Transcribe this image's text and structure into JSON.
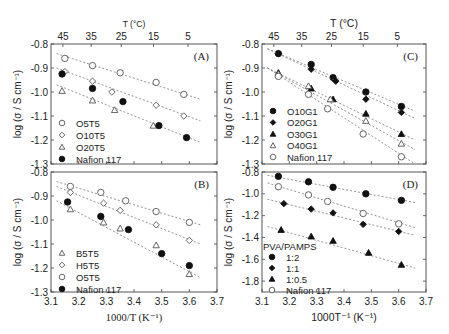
{
  "chart_data": [
    {
      "id": "A",
      "type": "scatter",
      "panel_label": "(A)",
      "frame": {
        "x0": 51,
        "x1": 217,
        "y0": 44,
        "y1": 164
      },
      "xlim": [
        3.1,
        3.7
      ],
      "ylim": [
        -1.3,
        -0.8
      ],
      "yticks": [
        -0.8,
        -0.9,
        -1.0,
        -1.1,
        -1.2,
        -1.3
      ],
      "ytick_labels": [
        "-0.8",
        "-0.9",
        "-1.0",
        "-1.1",
        "-1.2",
        "-1.3"
      ],
      "top_axis": {
        "label": "T (°C)",
        "ticks": [
          45,
          35,
          25,
          15,
          5
        ]
      },
      "ylabel": "log (σ / S cm⁻¹)",
      "xlabel": "",
      "legend": {
        "x": 62,
        "y": 126,
        "dy": 12
      },
      "series": [
        {
          "name": "O5T5",
          "marker": "circle-open",
          "x": [
            3.15,
            3.25,
            3.35,
            3.48,
            3.58
          ],
          "y": [
            -0.86,
            -0.89,
            -0.92,
            -0.96,
            -1.01
          ],
          "fit": [
            [
              3.12,
              -0.84
            ],
            [
              3.64,
              -1.03
            ]
          ]
        },
        {
          "name": "O10T5",
          "marker": "diamond-open",
          "x": [
            3.15,
            3.25,
            3.32,
            3.48,
            3.58
          ],
          "y": [
            -0.915,
            -0.955,
            -1.0,
            -1.055,
            -1.1
          ],
          "fit": [
            [
              3.12,
              -0.9
            ],
            [
              3.64,
              -1.12
            ]
          ]
        },
        {
          "name": "O20T5",
          "marker": "triangle-open",
          "x": [
            3.14,
            3.25,
            3.33,
            3.47
          ],
          "y": [
            -0.995,
            -1.035,
            -1.075,
            -1.14
          ],
          "fit": [
            [
              3.12,
              -0.97
            ],
            [
              3.64,
              -1.21
            ]
          ]
        },
        {
          "name": "Nafion 117",
          "marker": "circle-filled",
          "x": [
            3.14,
            3.25,
            3.36,
            3.49,
            3.59
          ],
          "y": [
            -0.925,
            -0.985,
            -1.04,
            -1.14,
            -1.19
          ],
          "fit": null
        }
      ]
    },
    {
      "id": "B",
      "type": "scatter",
      "panel_label": "(B)",
      "frame": {
        "x0": 51,
        "x1": 217,
        "y0": 172,
        "y1": 292
      },
      "xlim": [
        3.1,
        3.7
      ],
      "ylim": [
        -1.3,
        -0.8
      ],
      "xticks": [
        3.1,
        3.2,
        3.3,
        3.4,
        3.5,
        3.6,
        3.7
      ],
      "xtick_labels": [
        "3.1",
        "3.2",
        "3.3",
        "3.4",
        "3.5",
        "3.6",
        "3.7"
      ],
      "yticks": [
        -0.8,
        -0.9,
        -1.0,
        -1.1,
        -1.2,
        -1.3
      ],
      "ytick_labels": [
        "-0.8",
        "-0.9",
        "-1.0",
        "-1.1",
        "-1.2",
        "-1.3"
      ],
      "ylabel": "log (σ / S cm⁻¹)",
      "xlabel": "1000/T (K⁻¹)",
      "legend": {
        "x": 62,
        "y": 256,
        "dy": 12
      },
      "series": [
        {
          "name": "B5T5",
          "marker": "triangle-open",
          "x": [
            3.17,
            3.29,
            3.35,
            3.48,
            3.6
          ],
          "y": [
            -0.955,
            -1.01,
            -1.035,
            -1.105,
            -1.225
          ],
          "fit": [
            [
              3.12,
              -0.92
            ],
            [
              3.64,
              -1.24
            ]
          ]
        },
        {
          "name": "H5T5",
          "marker": "diamond-open",
          "x": [
            3.17,
            3.29,
            3.35,
            3.48,
            3.6
          ],
          "y": [
            -0.885,
            -0.93,
            -0.96,
            -1.02,
            -1.085
          ],
          "fit": [
            [
              3.12,
              -0.86
            ],
            [
              3.64,
              -1.1
            ]
          ]
        },
        {
          "name": "O5T5",
          "marker": "circle-open",
          "x": [
            3.17,
            3.28,
            3.37,
            3.48,
            3.6
          ],
          "y": [
            -0.86,
            -0.885,
            -0.92,
            -0.965,
            -1.01
          ],
          "fit": [
            [
              3.12,
              -0.84
            ],
            [
              3.64,
              -1.02
            ]
          ]
        },
        {
          "name": "Nafion 117",
          "marker": "circle-filled",
          "x": [
            3.16,
            3.28,
            3.38,
            3.5,
            3.6
          ],
          "y": [
            -0.925,
            -0.985,
            -1.04,
            -1.14,
            -1.19
          ],
          "fit": null
        }
      ]
    },
    {
      "id": "C",
      "type": "scatter",
      "panel_label": "(C)",
      "frame": {
        "x0": 262,
        "x1": 426,
        "y0": 44,
        "y1": 164
      },
      "xlim": [
        3.1,
        3.7
      ],
      "ylim": [
        -1.3,
        -0.8
      ],
      "yticks": [
        -0.8,
        -0.9,
        -1.0,
        -1.1,
        -1.2,
        -1.3
      ],
      "ytick_labels": [
        "-0.8",
        "-0.9",
        "-1.0",
        "-1.1",
        "-1.2",
        "-1.3"
      ],
      "top_axis": {
        "label": "T (°C)",
        "ticks": [
          45,
          35,
          25,
          15,
          5
        ]
      },
      "ylabel": "log (σ / S cm⁻¹)",
      "xlabel": "",
      "legend": {
        "x": 273,
        "y": 114,
        "dy": 11.5
      },
      "series": [
        {
          "name": "O10G1",
          "marker": "circle-filled",
          "x": [
            3.16,
            3.28,
            3.36,
            3.48,
            3.61
          ],
          "y": [
            -0.84,
            -0.885,
            -0.94,
            -1.0,
            -1.06
          ],
          "fit": [
            [
              3.12,
              -0.82
            ],
            [
              3.66,
              -1.08
            ]
          ]
        },
        {
          "name": "O20G1",
          "marker": "diamond-filled",
          "x": [
            3.16,
            3.28,
            3.37,
            3.48,
            3.61
          ],
          "y": [
            -0.84,
            -0.905,
            -0.955,
            -1.03,
            -1.085
          ],
          "fit": [
            [
              3.12,
              -0.82
            ],
            [
              3.66,
              -1.11
            ]
          ]
        },
        {
          "name": "O30G1",
          "marker": "triangle-filled",
          "x": [
            3.16,
            3.28,
            3.36,
            3.48,
            3.61
          ],
          "y": [
            -0.92,
            -0.985,
            -1.03,
            -1.09,
            -1.175
          ],
          "fit": [
            [
              3.12,
              -0.9
            ],
            [
              3.66,
              -1.2
            ]
          ]
        },
        {
          "name": "O40G1",
          "marker": "triangle-open",
          "x": [
            3.16,
            3.27,
            3.35,
            3.48,
            3.61
          ],
          "y": [
            -0.925,
            -0.975,
            -1.03,
            -1.12,
            -1.215
          ],
          "fit": [
            [
              3.12,
              -0.9
            ],
            [
              3.66,
              -1.24
            ]
          ]
        },
        {
          "name": "Nafion 117",
          "marker": "circle-open",
          "x": [
            3.16,
            3.27,
            3.34,
            3.47,
            3.61
          ],
          "y": [
            -0.935,
            -1.01,
            -1.07,
            -1.175,
            -1.27
          ],
          "fit": [
            [
              3.12,
              -0.9
            ],
            [
              3.66,
              -1.3
            ]
          ]
        }
      ]
    },
    {
      "id": "D",
      "type": "scatter",
      "panel_label": "(D)",
      "frame": {
        "x0": 262,
        "x1": 426,
        "y0": 172,
        "y1": 292
      },
      "xlim": [
        3.1,
        3.7
      ],
      "ylim": [
        -1.9,
        -0.8
      ],
      "xticks": [
        3.1,
        3.2,
        3.3,
        3.4,
        3.5,
        3.6,
        3.7
      ],
      "xtick_labels": [
        "3.1",
        "3.2",
        "3.3",
        "3.4",
        "3.5",
        "3.6",
        "3.7"
      ],
      "yticks": [
        -0.8,
        -1.0,
        -1.2,
        -1.4,
        -1.6,
        -1.8
      ],
      "ytick_labels": [
        "-0.8",
        "-1.0",
        "-1.2",
        "-1.4",
        "-1.6",
        "-1.8"
      ],
      "ylabel": "log (σ / S cm⁻¹)",
      "xlabel": "1000T⁻¹ (K⁻¹)",
      "legend_title": "PVA/PAMPS",
      "legend": {
        "x": 272,
        "y": 256,
        "dy": 11
      },
      "series": [
        {
          "name": "1:2",
          "marker": "circle-filled",
          "x": [
            3.16,
            3.27,
            3.36,
            3.48,
            3.61
          ],
          "y": [
            -0.84,
            -0.89,
            -0.94,
            -1.0,
            -1.06
          ],
          "fit": [
            [
              3.12,
              -0.83
            ],
            [
              3.66,
              -1.08
            ]
          ]
        },
        {
          "name": "1:1",
          "marker": "diamond-filled",
          "x": [
            3.18,
            3.28,
            3.36,
            3.47,
            3.6
          ],
          "y": [
            -1.09,
            -1.14,
            -1.175,
            -1.28,
            -1.345
          ],
          "fit": [
            [
              3.12,
              -1.05
            ],
            [
              3.66,
              -1.38
            ]
          ]
        },
        {
          "name": "1:0.5",
          "marker": "triangle-filled",
          "x": [
            3.17,
            3.28,
            3.36,
            3.49,
            3.61
          ],
          "y": [
            -1.33,
            -1.39,
            -1.43,
            -1.54,
            -1.65
          ],
          "fit": [
            [
              3.12,
              -1.3
            ],
            [
              3.66,
              -1.68
            ]
          ]
        },
        {
          "name": "Nafion 117",
          "marker": "circle-open",
          "x": [
            3.16,
            3.27,
            3.34,
            3.47,
            3.6
          ],
          "y": [
            -0.935,
            -1.01,
            -1.07,
            -1.18,
            -1.275
          ],
          "fit": [
            [
              3.12,
              -0.9
            ],
            [
              3.66,
              -1.31
            ]
          ]
        }
      ]
    }
  ],
  "top_axis_mapping": {
    "celsius_to_invT": "1000/(T+273.15)"
  }
}
